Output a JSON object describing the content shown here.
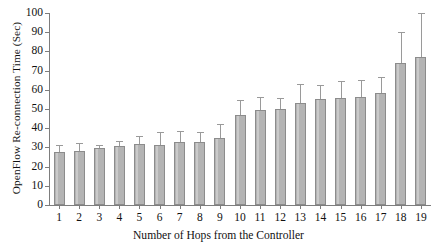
{
  "chart_data": {
    "type": "bar",
    "title": "",
    "xlabel": "Number of Hops from the Controller",
    "ylabel": "OpenFlow Re-connection Time (Sec)",
    "categories": [
      "1",
      "2",
      "3",
      "4",
      "5",
      "6",
      "7",
      "8",
      "9",
      "10",
      "11",
      "12",
      "13",
      "14",
      "15",
      "16",
      "17",
      "18",
      "19"
    ],
    "values": [
      27.5,
      28.0,
      29.5,
      30.5,
      32.0,
      31.5,
      33.0,
      33.0,
      35.0,
      47.0,
      49.5,
      50.0,
      53.0,
      55.0,
      55.5,
      56.0,
      58.5,
      74.0,
      77.0
    ],
    "errors_upper": [
      4.0,
      4.5,
      2.0,
      3.0,
      4.0,
      6.5,
      5.5,
      5.0,
      7.0,
      7.5,
      6.5,
      5.5,
      10.0,
      7.5,
      9.0,
      9.0,
      8.0,
      16.0,
      23.0
    ],
    "errors_lower": [
      0,
      0,
      0,
      0,
      0,
      0,
      0,
      0,
      0,
      0,
      0,
      0,
      0,
      0,
      0,
      0,
      0,
      0,
      0
    ],
    "ylim": [
      0,
      100
    ],
    "yticks": [
      0,
      10,
      20,
      30,
      40,
      50,
      60,
      70,
      80,
      90,
      100
    ],
    "xlim_categories": 19,
    "grid": false,
    "legend": "none",
    "bar_color": "#b4b4b4",
    "bar_edge_color": "#8c8c8c",
    "axis_color": "#7d7d7d",
    "background": "#ffffff"
  }
}
